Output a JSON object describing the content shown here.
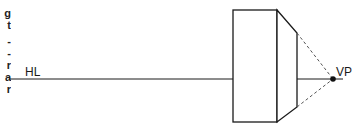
{
  "diagram": {
    "type": "one-point-perspective",
    "labels": {
      "horizon_line": "HL",
      "vanishing_point": "VP"
    },
    "colors": {
      "line": "#1a1a1a",
      "dashed": "#555555",
      "background": "#ffffff"
    },
    "clipped_margin_text": [
      "g",
      "t",
      "-",
      "-",
      "r",
      "a",
      "r"
    ]
  }
}
